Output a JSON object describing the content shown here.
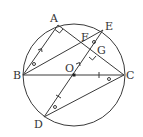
{
  "diagram": {
    "type": "geometry",
    "colors": {
      "stroke": "#3a3a3a",
      "text": "#333333",
      "background": "#ffffff"
    },
    "circle": {
      "center": "O",
      "cx": 74,
      "cy": 75,
      "r": 51
    },
    "points": {
      "A": {
        "label": "A",
        "x": 58,
        "y": 25
      },
      "E": {
        "label": "E",
        "x": 103,
        "y": 30
      },
      "F": {
        "label": "F",
        "x": 86,
        "y": 45
      },
      "G": {
        "label": "G",
        "x": 93,
        "y": 52
      },
      "B": {
        "label": "B",
        "x": 23,
        "y": 75
      },
      "O": {
        "label": "O",
        "x": 74,
        "y": 75
      },
      "C": {
        "label": "C",
        "x": 124,
        "y": 75
      },
      "D": {
        "label": "D",
        "x": 44,
        "y": 117
      }
    },
    "segments": [
      [
        "B",
        "A"
      ],
      [
        "A",
        "C"
      ],
      [
        "B",
        "E"
      ],
      [
        "B",
        "C"
      ],
      [
        "D",
        "E"
      ],
      [
        "D",
        "C"
      ]
    ],
    "marks": {
      "right_angles": [
        "A",
        "G"
      ],
      "parallel_arrows": [
        "BA",
        "OG"
      ],
      "equal_angle_circles": [
        "ABE",
        "FEG",
        "BCD",
        "ODC"
      ],
      "equal_length_ticks": [
        "OC",
        "OD"
      ]
    }
  }
}
